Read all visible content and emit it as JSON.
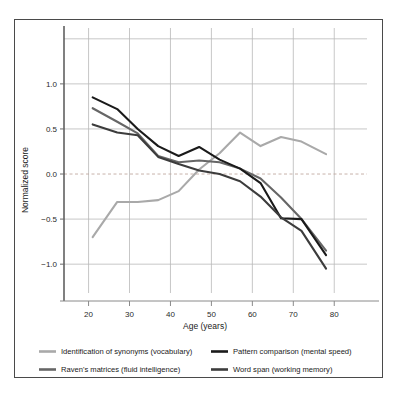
{
  "chart_data": {
    "type": "line",
    "title": "",
    "xlabel": "Age (years)",
    "ylabel": "Normalized score",
    "xlim": [
      14,
      88
    ],
    "ylim": [
      -1.32,
      1.62
    ],
    "xticks": [
      20,
      30,
      40,
      50,
      60,
      70,
      80
    ],
    "xtick_labels": [
      "20",
      "30",
      "40",
      "50",
      "60",
      "70",
      "80"
    ],
    "yticks": [
      -1.0,
      -0.5,
      0.0,
      0.5,
      1.0
    ],
    "ytick_labels": [
      "−1.0",
      "−0.5",
      "0.0",
      "0.5",
      "1.0"
    ],
    "gridlines_y": [
      -1.0,
      -0.5,
      0.0,
      0.5,
      1.0,
      1.5
    ],
    "grid": true,
    "zero_line": 0.0,
    "legend_position": "below-plot",
    "series": [
      {
        "name": "Identification of synonyms (vocabulary)",
        "color": "#a9a9a9",
        "x": [
          21,
          27,
          32,
          37,
          42,
          47,
          52,
          57,
          62,
          67,
          72,
          78
        ],
        "y": [
          -0.7,
          -0.31,
          -0.31,
          -0.29,
          -0.19,
          0.05,
          0.23,
          0.46,
          0.31,
          0.41,
          0.36,
          0.22
        ]
      },
      {
        "name": "Raven's matrices (fluid intelligence)",
        "color": "#666666",
        "x": [
          21,
          27,
          32,
          37,
          42,
          47,
          52,
          57,
          62,
          67,
          72,
          78
        ],
        "y": [
          0.73,
          0.58,
          0.45,
          0.2,
          0.13,
          0.15,
          0.13,
          0.06,
          -0.05,
          -0.26,
          -0.5,
          -0.85
        ]
      },
      {
        "name": "Pattern comparison (mental speed)",
        "color": "#1a1a1a",
        "x": [
          21,
          27,
          32,
          37,
          42,
          47,
          52,
          57,
          62,
          67,
          72,
          78
        ],
        "y": [
          0.85,
          0.72,
          0.5,
          0.31,
          0.2,
          0.3,
          0.16,
          0.06,
          -0.1,
          -0.49,
          -0.5,
          -0.9
        ]
      },
      {
        "name": "Word span (working memory)",
        "color": "#3c3c3c",
        "x": [
          21,
          27,
          32,
          37,
          42,
          47,
          52,
          57,
          62,
          67,
          72,
          78
        ],
        "y": [
          0.55,
          0.46,
          0.43,
          0.19,
          0.11,
          0.04,
          0.0,
          -0.08,
          -0.25,
          -0.48,
          -0.63,
          -1.05
        ]
      }
    ]
  },
  "legend": {
    "items": [
      {
        "label": "Identification of synonyms (vocabulary)",
        "color": "#a9a9a9"
      },
      {
        "label": "Pattern comparison (mental speed)",
        "color": "#1a1a1a"
      },
      {
        "label": "Raven's matrices (fluid intelligence)",
        "color": "#666666"
      },
      {
        "label": "Word span (working memory)",
        "color": "#3c3c3c"
      }
    ]
  }
}
